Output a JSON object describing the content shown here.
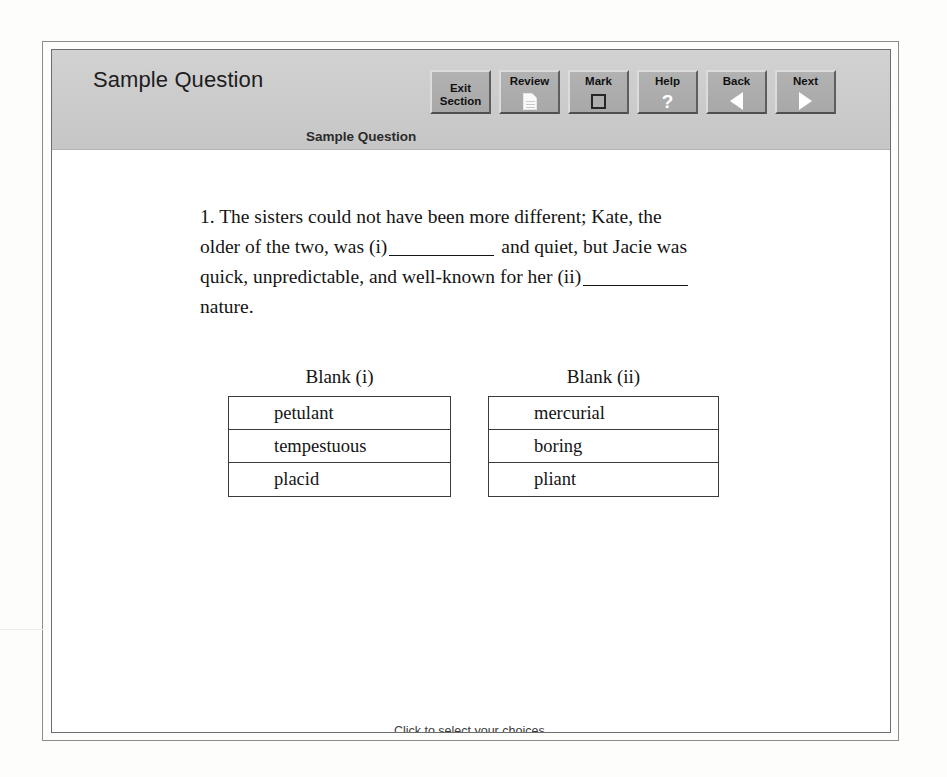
{
  "header": {
    "title": "Sample Question",
    "subtitle": "Sample Question"
  },
  "toolbar": {
    "buttons": [
      {
        "label_line1": "Exit",
        "label_line2": "Section",
        "icon": "none"
      },
      {
        "label_line1": "Review",
        "label_line2": "",
        "icon": "document-icon"
      },
      {
        "label_line1": "Mark",
        "label_line2": "",
        "icon": "checkbox-icon"
      },
      {
        "label_line1": "Help",
        "label_line2": "",
        "icon": "question-mark-icon"
      },
      {
        "label_line1": "Back",
        "label_line2": "",
        "icon": "arrow-left-icon"
      },
      {
        "label_line1": "Next",
        "label_line2": "",
        "icon": "arrow-right-icon"
      }
    ]
  },
  "question": {
    "number": "1.",
    "part1": "The sisters could not have been more different; Kate, the older of the two, was (i)",
    "part2": "and quiet, but Jacie was quick, unpredictable, and well-known for her (ii)",
    "part3": "nature."
  },
  "blanks": [
    {
      "caption": "Blank (i)",
      "options": [
        "petulant",
        "tempestuous",
        "placid"
      ]
    },
    {
      "caption": "Blank (ii)",
      "options": [
        "mercurial",
        "boring",
        "pliant"
      ]
    }
  ],
  "footer": {
    "instruction": "Click to select your choices."
  },
  "colors": {
    "header_band": "#cccccc",
    "button_face": "#aaaaaa",
    "text": "#141414",
    "frame": "#6d6d6d"
  }
}
